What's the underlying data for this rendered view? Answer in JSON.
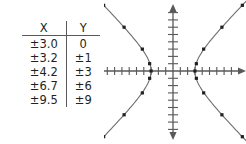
{
  "figure": {
    "name": "hyperbola-table-and-graph"
  },
  "table": {
    "title": "table-of-values",
    "columns": [
      "X",
      "Y"
    ],
    "rows": [
      {
        "x": "±3.0",
        "y": "0"
      },
      {
        "x": "±3.2",
        "y": "±1"
      },
      {
        "x": "±4.2",
        "y": "±3"
      },
      {
        "x": "±6.7",
        "y": "±6"
      },
      {
        "x": "±9.5",
        "y": "±9"
      }
    ]
  },
  "graph": {
    "description": "coordinate plane with a horizontally opening hyperbola",
    "axis_color": "#58595b",
    "curve_color": "#6d6e71",
    "point_color": "#231f20"
  },
  "chart_data": {
    "type": "scatter",
    "title": "",
    "xlabel": "X",
    "ylabel": "Y",
    "grid": false,
    "legend": null,
    "xlim": [
      -10.5,
      10.5
    ],
    "ylim": [
      -10.5,
      10.5
    ],
    "x_tick_step": 1,
    "y_tick_step": 1,
    "series": [
      {
        "name": "right branch",
        "x": [
          3.0,
          3.2,
          4.2,
          6.7,
          9.5
        ],
        "y": [
          0,
          1,
          3,
          6,
          9
        ],
        "mirrored_y": true
      },
      {
        "name": "left branch",
        "x": [
          -3.0,
          -3.2,
          -4.2,
          -6.7,
          -9.5
        ],
        "y": [
          0,
          1,
          3,
          6,
          9
        ],
        "mirrored_y": true
      }
    ],
    "plotted_points": [
      {
        "x": 3.0,
        "y": 0
      },
      {
        "x": 3.2,
        "y": 1
      },
      {
        "x": 3.2,
        "y": -1
      },
      {
        "x": 4.2,
        "y": 3
      },
      {
        "x": 4.2,
        "y": -3
      },
      {
        "x": 6.7,
        "y": 6
      },
      {
        "x": 6.7,
        "y": -6
      },
      {
        "x": 9.5,
        "y": 9
      },
      {
        "x": 9.5,
        "y": -9
      },
      {
        "x": -3.0,
        "y": 0
      },
      {
        "x": -3.2,
        "y": 1
      },
      {
        "x": -3.2,
        "y": -1
      },
      {
        "x": -4.2,
        "y": 3
      },
      {
        "x": -4.2,
        "y": -3
      },
      {
        "x": -6.7,
        "y": 6
      },
      {
        "x": -6.7,
        "y": -6
      },
      {
        "x": -9.5,
        "y": 9
      },
      {
        "x": -9.5,
        "y": -9
      }
    ]
  }
}
